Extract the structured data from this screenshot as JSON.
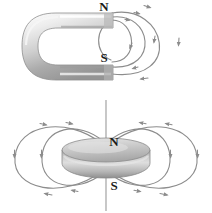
{
  "figure": {
    "background_color": "#ffffff",
    "field_line_color": "#8c8c8c",
    "label_color": "#1a1a1a",
    "magnet_light": "#f2f2f2",
    "magnet_mid": "#bdbdbd",
    "magnet_dark": "#8f8f8f"
  },
  "panels": [
    {
      "id": "horseshoe-magnet-panel",
      "name": "Horseshoe magnet with magnetic field lines",
      "magnet": {
        "type": "horseshoe",
        "opening_direction": "right",
        "poles": [
          {
            "label": "N",
            "position": "upper-arm-tip"
          },
          {
            "label": "S",
            "position": "lower-arm-tip"
          }
        ]
      },
      "field_lines": {
        "count": 4,
        "direction": "N to S",
        "description": "Nested arcs leaving the north pole and curving round into the south pole",
        "arrowheads_per_line": 2
      }
    },
    {
      "id": "disc-magnet-panel",
      "name": "Disc magnet with magnetic field lines",
      "magnet": {
        "type": "disc",
        "orientation": "horizontal",
        "axis_line": true,
        "poles": [
          {
            "label": "N",
            "position": "above-disc"
          },
          {
            "label": "S",
            "position": "below-disc"
          }
        ]
      },
      "field_lines": {
        "count": 4,
        "direction": "N to S",
        "description": "Two nested closed loops on each side of the disc, leaving the north face and returning to the south face",
        "arrowheads_per_line": 4
      }
    }
  ],
  "labels": {
    "horseshoe_north": "N",
    "horseshoe_south": "S",
    "disc_north": "N",
    "disc_south": "S"
  }
}
